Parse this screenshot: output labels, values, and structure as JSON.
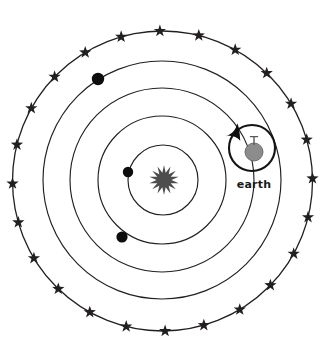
{
  "diagram": {
    "background_color": "#ffffff",
    "canvas": {
      "width": 336,
      "height": 357
    },
    "line_color": "#231f20",
    "sun": {
      "label": "sun",
      "shape": "starburst",
      "points": 14,
      "color": "#4d4d4d",
      "center": {
        "x": 164,
        "y": 180
      },
      "outer_radius": 15,
      "inner_radius": 7.5
    },
    "orbits": [
      {
        "name": "orbit-1",
        "center": {
          "x": 163,
          "y": 180
        },
        "radius": 35
      },
      {
        "name": "orbit-2",
        "center": {
          "x": 162,
          "y": 180
        },
        "radius": 64
      },
      {
        "name": "orbit-3",
        "center": {
          "x": 162,
          "y": 180
        },
        "radius": 92
      },
      {
        "name": "orbit-4",
        "center": {
          "x": 162,
          "y": 180
        },
        "radius": 119
      },
      {
        "name": "orbit-5-outer",
        "center": {
          "x": 162.5,
          "y": 181
        },
        "radius": 150
      }
    ],
    "planets": [
      {
        "name": "planet-inner",
        "center": {
          "x": 128,
          "y": 172
        },
        "radius": 5.2,
        "color": "#0d0d0d"
      },
      {
        "name": "planet-middle",
        "center": {
          "x": 122,
          "y": 237
        },
        "radius": 5.6,
        "color": "#0d0d0d"
      },
      {
        "name": "planet-outer",
        "center": {
          "x": 98,
          "y": 79
        },
        "radius": 6.2,
        "color": "#0d0d0d"
      }
    ],
    "earth": {
      "label": "earth",
      "orb_center": {
        "x": 252,
        "y": 148
      },
      "orb_radius": 23,
      "globe_center": {
        "x": 254,
        "y": 152
      },
      "globe_radius": 9,
      "globe_color": "#8c8c8c",
      "axis_color": "#5a5a5a",
      "rotation_arrow": "counterclockwise-arrowhead",
      "caption_position": {
        "x": 254,
        "y": 188
      }
    },
    "fixed_stars": {
      "count": 24,
      "color": "#231f20",
      "radius_on_ring": 150,
      "star_size": 8.5,
      "angles_deg": [
        -76,
        -61,
        -46,
        -31,
        -16,
        -1,
        14,
        29,
        44,
        59,
        74,
        89,
        104,
        119,
        134,
        149,
        164,
        179,
        194,
        209,
        224,
        239,
        254,
        269
      ]
    }
  }
}
